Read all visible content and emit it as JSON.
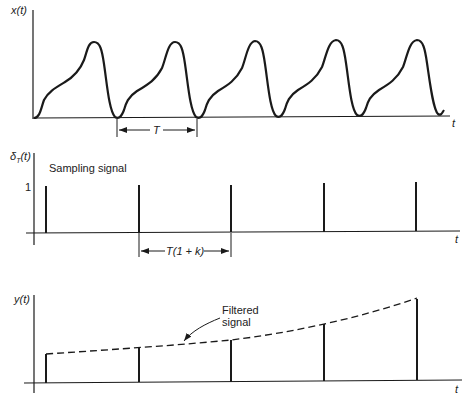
{
  "panels": [
    {
      "id": "continuous",
      "ylabel": "x(t)",
      "xlabel": "t",
      "period_label": "T",
      "description": "Periodic waveform with five cycles"
    },
    {
      "id": "sampling",
      "ylabel": "δT(t)",
      "ylabel_main": "δ",
      "ylabel_sub": "T",
      "ylabel_rest": "(t)",
      "xlabel": "t",
      "title": "Sampling signal",
      "unit_tick": "1",
      "interval_label": "T(1 + k)",
      "impulse_count": 5
    },
    {
      "id": "output",
      "ylabel": "y(t)",
      "xlabel": "t",
      "annotation_line1": "Filtered",
      "annotation_line2": "signal",
      "impulse_count": 5
    }
  ],
  "colors": {
    "ink": "#1a1a1a",
    "background": "#ffffff"
  }
}
